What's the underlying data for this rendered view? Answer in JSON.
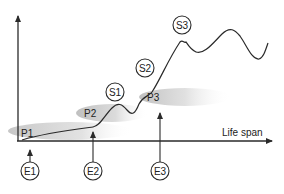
{
  "diagram": {
    "x_axis_label": "Life span",
    "phases": [
      {
        "id": "p1",
        "label": "P1"
      },
      {
        "id": "p2",
        "label": "P2"
      },
      {
        "id": "p3",
        "label": "P3"
      }
    ],
    "stages": [
      {
        "id": "s1",
        "label": "S1"
      },
      {
        "id": "s2",
        "label": "S2"
      },
      {
        "id": "s3",
        "label": "S3"
      }
    ],
    "events": [
      {
        "id": "e1",
        "label": "E1"
      },
      {
        "id": "e2",
        "label": "E2"
      },
      {
        "id": "e3",
        "label": "E3"
      }
    ],
    "colors": {
      "line": "#2a2a2a",
      "shade": "#bdbdbd",
      "background": "#ffffff"
    }
  }
}
